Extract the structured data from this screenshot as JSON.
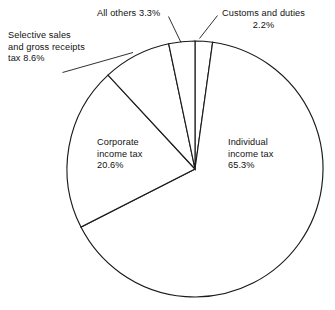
{
  "chart_data": {
    "type": "pie",
    "title": "",
    "subtitle": "",
    "xlabel": "",
    "ylabel": "",
    "legend_position": "callout-labels",
    "grid": false,
    "units": "percent",
    "total": 100.0,
    "center": {
      "x": 195,
      "y": 169
    },
    "radius": 128,
    "start_angle_deg": -90,
    "direction": "clockwise",
    "categories": [
      "Customs and duties",
      "Individual income tax",
      "Corporate income tax",
      "Selective sales and gross receipts tax",
      "All others"
    ],
    "values": [
      2.2,
      65.3,
      20.6,
      8.6,
      3.3
    ],
    "slices": [
      {
        "name": "Customs and duties",
        "value": 2.2,
        "value_label": "2.2%",
        "label_lines": [
          "Customs and duties",
          "2.2%"
        ],
        "label_placement": "outside-right-top",
        "has_leader": true,
        "fill": "#ffffff",
        "stroke": "#1a1a1a"
      },
      {
        "name": "Individual income tax",
        "value": 65.3,
        "value_label": "65.3%",
        "label_lines": [
          "Individual",
          "income tax",
          "65.3%"
        ],
        "label_placement": "inside-right",
        "has_leader": false,
        "fill": "#ffffff",
        "stroke": "#1a1a1a"
      },
      {
        "name": "Corporate income tax",
        "value": 20.6,
        "value_label": "20.6%",
        "label_lines": [
          "Corporate",
          "income tax",
          "20.6%"
        ],
        "label_placement": "inside-left",
        "has_leader": false,
        "fill": "#ffffff",
        "stroke": "#1a1a1a"
      },
      {
        "name": "Selective sales and gross receipts tax",
        "value": 8.6,
        "value_label": "8.6%",
        "label_lines": [
          "Selective sales",
          "and gross receipts",
          "tax 8.6%"
        ],
        "label_placement": "outside-left-top",
        "has_leader": true,
        "fill": "#ffffff",
        "stroke": "#1a1a1a"
      },
      {
        "name": "All others",
        "value": 3.3,
        "value_label": "3.3%",
        "label_lines": [
          "All others 3.3%"
        ],
        "label_placement": "outside-top",
        "has_leader": true,
        "fill": "#ffffff",
        "stroke": "#1a1a1a"
      }
    ]
  },
  "labels": {
    "selective_sales": "Selective sales\nand gross receipts\ntax 8.6%",
    "all_others": "All others 3.3%",
    "customs": "Customs and duties\n2.2%",
    "corporate": "Corporate\nincome tax\n20.6%",
    "individual": "Individual\nincome tax\n65.3%"
  },
  "colors": {
    "background": "#ffffff",
    "stroke": "#1a1a1a",
    "text": "#111111"
  }
}
